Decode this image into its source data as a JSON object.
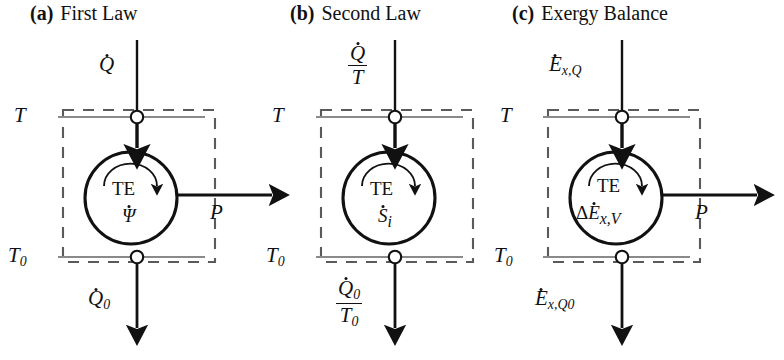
{
  "figure": {
    "caption_style": "three-panel control volume schematic",
    "panels": [
      {
        "tag": "(a)",
        "title": "First Law",
        "title_x": 30,
        "title_y": 4,
        "origin_x": 0,
        "reservoir_hot_label": "T",
        "reservoir_cold_label": "T",
        "reservoir_cold_sub": "0",
        "inlet_label_kind": "plain",
        "inlet_symbol": "Q",
        "inlet_dot": true,
        "inlet_sub": "",
        "inlet_den_symbol": "",
        "inlet_den_sub": "",
        "outlet_label_kind": "plain",
        "outlet_symbol": "Q",
        "outlet_dot": true,
        "outlet_sub": "0",
        "outlet_den_symbol": "",
        "outlet_den_sub": "",
        "device_label": "TE",
        "inner_symbol": "Ψ",
        "inner_dot": true,
        "inner_prefix": "",
        "inner_sub": "",
        "work_label": "P"
      },
      {
        "tag": "(b)",
        "title": "Second Law",
        "title_x": 290,
        "title_y": 4,
        "origin_x": 258,
        "reservoir_hot_label": "T",
        "reservoir_cold_label": "T",
        "reservoir_cold_sub": "0",
        "inlet_label_kind": "fraction",
        "inlet_symbol": "Q",
        "inlet_dot": true,
        "inlet_sub": "",
        "inlet_den_symbol": "T",
        "inlet_den_sub": "",
        "outlet_label_kind": "fraction",
        "outlet_symbol": "Q",
        "outlet_dot": true,
        "outlet_sub": "0",
        "outlet_den_symbol": "T",
        "outlet_den_sub": "0",
        "device_label": "TE",
        "inner_symbol": "S",
        "inner_dot": true,
        "inner_prefix": "",
        "inner_sub": "i",
        "work_label": ""
      },
      {
        "tag": "(c)",
        "title": "Exergy Balance",
        "title_x": 512,
        "title_y": 4,
        "origin_x": 485,
        "reservoir_hot_label": "T",
        "reservoir_cold_label": "T",
        "reservoir_cold_sub": "0",
        "inlet_label_kind": "plain",
        "inlet_symbol": "E",
        "inlet_dot": true,
        "inlet_sub": "x,Q",
        "inlet_den_symbol": "",
        "inlet_den_sub": "",
        "outlet_label_kind": "plain",
        "outlet_symbol": "E",
        "outlet_dot": true,
        "outlet_sub": "x,Q0",
        "outlet_den_symbol": "",
        "outlet_den_sub": "",
        "device_label": "TE",
        "inner_symbol": "E",
        "inner_dot": true,
        "inner_prefix": "Δ",
        "inner_sub": "x,V",
        "work_label": "P"
      }
    ],
    "colors": {
      "ink": "#111111",
      "dashed_boundary": "#5a5a5a",
      "reservoir_line": "#7a7a7a",
      "background": "#ffffff"
    },
    "geometry": {
      "box_left": 63,
      "box_right": 215,
      "box_top": 110,
      "box_bottom": 262,
      "port_x": 137,
      "circle_cx": 131,
      "circle_cy": 198,
      "circle_r": 46,
      "arrow_top_start_y": 40,
      "arrow_bottom_end_y": 330,
      "work_arrow_end_x": 277
    }
  }
}
